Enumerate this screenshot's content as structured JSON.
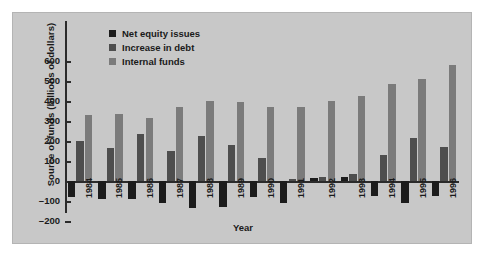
{
  "chart_data": {
    "type": "bar",
    "title": "",
    "xlabel": "Year",
    "ylabel": "Source of funds (billions of dollars)",
    "categories": [
      "1984",
      "1985",
      "1986",
      "1987",
      "1988",
      "1989",
      "1990",
      "1991",
      "1992",
      "1993",
      "1994",
      "1995",
      "1996"
    ],
    "series": [
      {
        "name": "Net equity issues",
        "color": "#1c1c1c",
        "values": [
          -80,
          -90,
          -90,
          -110,
          -135,
          -130,
          -80,
          -110,
          15,
          20,
          -75,
          -110,
          -75
        ]
      },
      {
        "name": "Increase in debt",
        "color": "#4e4e4e",
        "values": [
          200,
          165,
          235,
          150,
          225,
          180,
          115,
          10,
          20,
          35,
          130,
          215,
          170
        ]
      },
      {
        "name": "Internal funds",
        "color": "#7b7b7b",
        "values": [
          330,
          335,
          315,
          370,
          400,
          395,
          370,
          370,
          400,
          425,
          485,
          510,
          580
        ]
      }
    ],
    "yticks": [
      -200,
      -100,
      0,
      100,
      200,
      300,
      400,
      500,
      600
    ],
    "ylim": [
      -200,
      620
    ],
    "grid": false,
    "legend_position": "top-center"
  },
  "colors": {
    "figure_background": "#c8c8c8",
    "page_background": "#ffffff",
    "axis": "#2b2b2b",
    "text": "#1a1a1a"
  }
}
